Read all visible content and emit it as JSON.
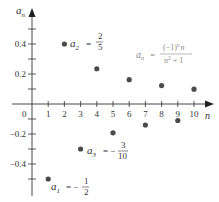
{
  "chart_data": {
    "type": "scatter",
    "title": "",
    "xlabel": "n",
    "ylabel": "a_n",
    "x": [
      1,
      2,
      3,
      4,
      5,
      6,
      7,
      8,
      9,
      10
    ],
    "values": [
      -0.5,
      0.4,
      -0.3,
      0.235,
      -0.192,
      0.162,
      -0.14,
      0.123,
      -0.11,
      0.099
    ],
    "x_ticks": [
      "0",
      "1",
      "2",
      "3",
      "4",
      "5",
      "6",
      "7",
      "8",
      "9",
      "10"
    ],
    "y_ticks": [
      "0.4",
      "0.2",
      "-0.2",
      "-0.4"
    ],
    "xlim": [
      0,
      11
    ],
    "ylim": [
      -0.6,
      0.55
    ],
    "grid": false,
    "legend": null,
    "annotations": [
      {
        "label": "a2 = 2/5",
        "target_n": 2
      },
      {
        "label": "a3 = -3/10",
        "target_n": 3
      },
      {
        "label": "a1 = -1/2",
        "target_n": 1
      },
      {
        "label": "a_n = (-1)^n n / (n^2 + 1)",
        "role": "formula"
      }
    ]
  },
  "labels": {
    "y_axis": "a",
    "y_axis_sub": "n",
    "x_axis": "n",
    "origin": "0",
    "a2_name": "a",
    "a2_sub": "2",
    "a2_eq": "=",
    "a2_num": "2",
    "a2_den": "5",
    "a3_name": "a",
    "a3_sub": "3",
    "a3_eq": "= −",
    "a3_num": "3",
    "a3_den": "10",
    "a1_name": "a",
    "a1_sub": "1",
    "a1_eq": "= −",
    "a1_num": "1",
    "a1_den": "2",
    "formula_lhs": "a",
    "formula_lhs_sub": "n",
    "formula_eq": "=",
    "formula_num": "(−1)",
    "formula_num_exp": "n",
    "formula_num_n": "n",
    "formula_den": "n",
    "formula_den_exp": "2",
    "formula_den_tail": "+ 1"
  }
}
